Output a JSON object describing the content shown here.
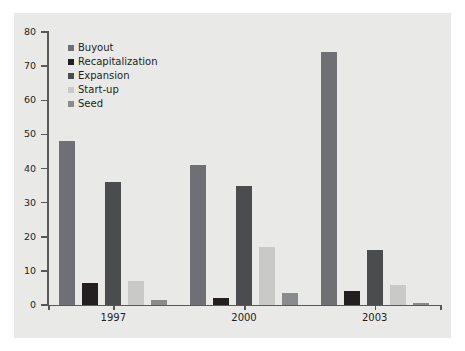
{
  "chart_data": {
    "type": "bar",
    "title": "",
    "subtitle": "",
    "xlabel": "",
    "ylabel": "",
    "categories": [
      "1997",
      "2000",
      "2003"
    ],
    "ylim": [
      0,
      80
    ],
    "yticks": [
      0,
      10,
      20,
      30,
      40,
      50,
      60,
      70,
      80
    ],
    "ytick_labels": [
      "0",
      "10",
      "20",
      "30",
      "40",
      "50",
      "60",
      "70",
      "80"
    ],
    "grid": false,
    "legend_position": "top-left-inside",
    "series": [
      {
        "name": "Buyout",
        "color": "#6f7073",
        "values": [
          48,
          41,
          74
        ]
      },
      {
        "name": "Recapitalization",
        "color": "#231f20",
        "values": [
          6.5,
          2,
          4
        ]
      },
      {
        "name": "Expansion",
        "color": "#4b4c4e",
        "values": [
          36,
          35,
          16
        ]
      },
      {
        "name": "Start-up",
        "color": "#c9c9c7",
        "values": [
          7,
          17,
          6
        ]
      },
      {
        "name": "Seed",
        "color": "#8a8b8d",
        "values": [
          1.5,
          3.5,
          0.7
        ]
      }
    ]
  },
  "style": {
    "panel_background": "#e9e9e7",
    "page_background": "#ffffff",
    "axis_color": "#58585a",
    "text_color": "#231f20"
  }
}
